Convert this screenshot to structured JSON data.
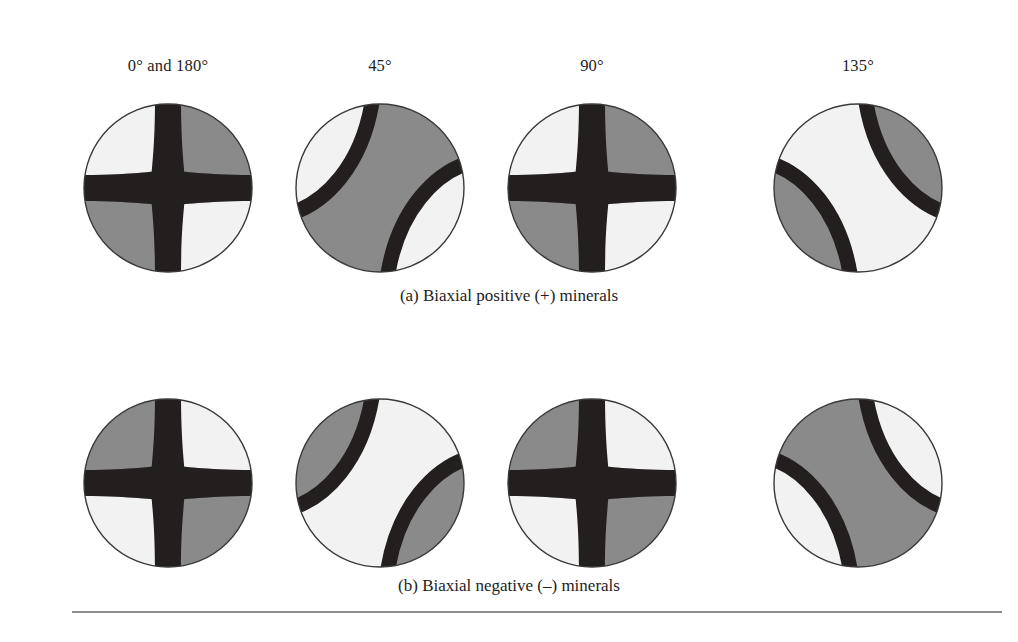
{
  "figure": {
    "frame_color": "#5d5d5d",
    "background": "#ffffff",
    "colors": {
      "light": "#f2f2f2",
      "gray": "#8a8a8a",
      "isogyre": "#231f1e",
      "outline": "#3a3a3a"
    },
    "column_headers": [
      {
        "label": "0° and 180°",
        "center_x": 168
      },
      {
        "label": "45°",
        "center_x": 380
      },
      {
        "label": "90°",
        "center_x": 592
      },
      {
        "label": "135°",
        "center_x": 858
      }
    ],
    "rows": [
      {
        "id": "a",
        "caption": "(a) Biaxial positive (+) minerals",
        "cells": [
          {
            "angle": "0° and 180°",
            "pattern": "cross",
            "center_x": 168,
            "quadrants": {
              "top_left": "light",
              "top_right": "gray",
              "bottom_left": "gray",
              "bottom_right": "light"
            }
          },
          {
            "angle": "45°",
            "pattern": "hyperbola-nwse",
            "center_x": 380,
            "corner_regions": "light",
            "central_band": "gray"
          },
          {
            "angle": "90°",
            "pattern": "cross",
            "center_x": 592,
            "quadrants": {
              "top_left": "light",
              "top_right": "gray",
              "bottom_left": "gray",
              "bottom_right": "light"
            }
          },
          {
            "angle": "135°",
            "pattern": "hyperbola-nesw",
            "center_x": 858,
            "corner_regions": "gray",
            "central_band": "light"
          }
        ]
      },
      {
        "id": "b",
        "caption": "(b) Biaxial negative (–) minerals",
        "cells": [
          {
            "angle": "0° and 180°",
            "pattern": "cross",
            "center_x": 168,
            "quadrants": {
              "top_left": "gray",
              "top_right": "light",
              "bottom_left": "light",
              "bottom_right": "gray"
            }
          },
          {
            "angle": "45°",
            "pattern": "hyperbola-nwse",
            "center_x": 380,
            "corner_regions": "gray",
            "central_band": "light"
          },
          {
            "angle": "90°",
            "pattern": "cross",
            "center_x": 592,
            "quadrants": {
              "top_left": "gray",
              "top_right": "light",
              "bottom_left": "light",
              "bottom_right": "gray"
            }
          },
          {
            "angle": "135°",
            "pattern": "hyperbola-nesw",
            "center_x": 858,
            "corner_regions": "light",
            "central_band": "gray"
          }
        ]
      }
    ]
  }
}
